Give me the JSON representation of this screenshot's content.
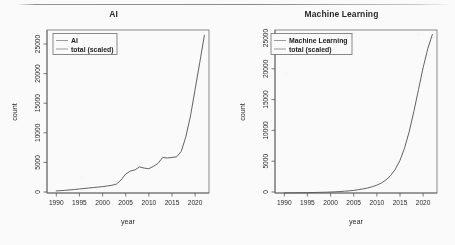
{
  "figure": {
    "panel_count": 2,
    "background_color": "#ffffff",
    "line_color": "#555555",
    "axis_color": "#5c5c5c",
    "text_color": "#1d1d1d"
  },
  "chart_data": [
    {
      "type": "line",
      "title": "AI",
      "xlabel": "year",
      "ylabel": "count",
      "xlim": [
        1988,
        2023
      ],
      "ylim": [
        0,
        27500
      ],
      "grid": false,
      "legend_position": "top-left",
      "legend_entries": [
        "AI",
        "total (scaled)"
      ],
      "xticks": [
        1990,
        1995,
        2000,
        2005,
        2010,
        2015,
        2020
      ],
      "yticks": [
        0,
        5000,
        10000,
        15000,
        20000,
        25000
      ],
      "xtick_labels": [
        "1990",
        "1995",
        "2000",
        "2005",
        "2010",
        "2015",
        "2020"
      ],
      "ytick_labels": [
        "0",
        "5000",
        "10000",
        "15000",
        "20000",
        "25000"
      ],
      "series": [
        {
          "name": "AI total (scaled)",
          "x": [
            1990,
            1991,
            1992,
            1993,
            1994,
            1995,
            1996,
            1997,
            1998,
            1999,
            2000,
            2001,
            2002,
            2003,
            2004,
            2005,
            2006,
            2007,
            2008,
            2009,
            2010,
            2011,
            2012,
            2013,
            2014,
            2015,
            2016,
            2017,
            2018,
            2019,
            2020,
            2021,
            2022
          ],
          "values": [
            350,
            400,
            460,
            520,
            600,
            680,
            760,
            840,
            920,
            1000,
            1080,
            1180,
            1300,
            1500,
            2200,
            3200,
            3700,
            3900,
            4400,
            4200,
            4100,
            4500,
            5000,
            6000,
            5900,
            6000,
            6100,
            7000,
            9500,
            13000,
            17500,
            22000,
            26600
          ]
        }
      ]
    },
    {
      "type": "line",
      "title": "Machine Learning",
      "xlabel": "year",
      "ylabel": "count",
      "xlim": [
        1988,
        2023
      ],
      "ylim": [
        0,
        26000
      ],
      "grid": false,
      "legend_position": "top-left",
      "legend_entries": [
        "Machine Learning",
        "total (scaled)"
      ],
      "xticks": [
        1990,
        1995,
        2000,
        2005,
        2010,
        2015,
        2020
      ],
      "yticks": [
        0,
        5000,
        10000,
        15000,
        20000,
        25000
      ],
      "xtick_labels": [
        "1990",
        "1995",
        "2000",
        "2005",
        "2010",
        "2015",
        "2020"
      ],
      "ytick_labels": [
        "0",
        "5000",
        "10000",
        "15000",
        "20000",
        "25000"
      ],
      "series": [
        {
          "name": "Machine Learning total (scaled)",
          "x": [
            1990,
            1991,
            1992,
            1993,
            1994,
            1995,
            1996,
            1997,
            1998,
            1999,
            2000,
            2001,
            2002,
            2003,
            2004,
            2005,
            2006,
            2007,
            2008,
            2009,
            2010,
            2011,
            2012,
            2013,
            2014,
            2015,
            2016,
            2017,
            2018,
            2019,
            2020,
            2021,
            2022
          ],
          "values": [
            20,
            25,
            30,
            40,
            50,
            60,
            75,
            90,
            110,
            130,
            160,
            190,
            230,
            280,
            340,
            420,
            520,
            650,
            800,
            1000,
            1250,
            1600,
            2100,
            2800,
            3800,
            5200,
            7200,
            9800,
            13000,
            16500,
            20000,
            23000,
            25300
          ]
        }
      ]
    }
  ]
}
